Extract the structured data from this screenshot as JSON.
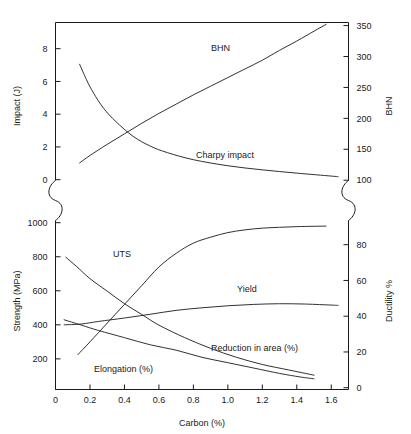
{
  "chart_data": {
    "type": "line",
    "title": "",
    "xlabel": "Carbon (%)",
    "xlim": [
      0,
      1.7
    ],
    "xticks": [
      0,
      0.2,
      0.4,
      0.6,
      0.8,
      1.0,
      1.2,
      1.4,
      1.6
    ],
    "xticklabels": [
      "0",
      "0.2",
      "0.4",
      "0.6",
      "0.8",
      "1.0",
      "1.2",
      "1.4",
      "1.6"
    ],
    "grid": false,
    "legend_position": "inline-annotations",
    "panels": [
      {
        "name": "upper-panel",
        "left_axis": {
          "label": "Impact (J)",
          "ticks": [
            0,
            2,
            4,
            6,
            8
          ],
          "ticklabels": [
            "0",
            "2",
            "4",
            "6",
            "8"
          ],
          "lim": [
            -0.6,
            9.6
          ]
        },
        "right_axis": {
          "label": "BHN",
          "ticks": [
            100,
            150,
            200,
            250,
            300,
            350
          ],
          "ticklabels": [
            "100",
            "150",
            "200",
            "250",
            "300",
            "350"
          ],
          "lim": [
            85,
            355
          ]
        },
        "series": [
          {
            "name": "BHN",
            "axis": "right",
            "label": "BHN",
            "x": [
              0.14,
              0.2,
              0.3,
              0.4,
              0.5,
              0.6,
              0.7,
              0.8,
              0.9,
              1.0,
              1.1,
              1.2,
              1.3,
              1.4,
              1.5,
              1.57
            ],
            "values": [
              128,
              140,
              158,
              175,
              192,
              208,
              223,
              238,
              252,
              266,
              280,
              294,
              310,
              325,
              341,
              352
            ]
          },
          {
            "name": "Charpy impact",
            "axis": "left",
            "label": "Charpy impact",
            "x": [
              0.14,
              0.18,
              0.22,
              0.28,
              0.35,
              0.45,
              0.55,
              0.65,
              0.8,
              1.0,
              1.2,
              1.4,
              1.6,
              1.64
            ],
            "values": [
              7.05,
              6.1,
              5.3,
              4.35,
              3.55,
              2.65,
              2.05,
              1.65,
              1.22,
              0.85,
              0.6,
              0.4,
              0.22,
              0.18
            ]
          }
        ]
      },
      {
        "name": "lower-panel",
        "left_axis": {
          "label": "Strength (MPa)",
          "ticks": [
            200,
            400,
            600,
            800,
            1000
          ],
          "ticklabels": [
            "200",
            "400",
            "600",
            "800",
            "1000"
          ],
          "lim": [
            20,
            1060
          ]
        },
        "right_axis": {
          "label": "Ductility %",
          "ticks": [
            0,
            20,
            40,
            60,
            80
          ],
          "ticklabels": [
            "0",
            "20",
            "40",
            "60",
            "80"
          ],
          "lim": [
            -1,
            98
          ]
        },
        "series": [
          {
            "name": "UTS",
            "axis": "left",
            "label": "UTS",
            "x": [
              0.13,
              0.2,
              0.3,
              0.4,
              0.5,
              0.6,
              0.7,
              0.8,
              0.9,
              1.0,
              1.1,
              1.2,
              1.3,
              1.4,
              1.5,
              1.57
            ],
            "values": [
              225,
              300,
              410,
              520,
              630,
              740,
              820,
              880,
              915,
              942,
              958,
              968,
              973,
              977,
              979,
              980
            ]
          },
          {
            "name": "Yield",
            "axis": "left",
            "label": "Yield",
            "x": [
              0.05,
              0.15,
              0.25,
              0.4,
              0.55,
              0.7,
              0.85,
              1.0,
              1.15,
              1.3,
              1.45,
              1.6,
              1.64
            ],
            "values": [
              400,
              405,
              420,
              440,
              462,
              485,
              500,
              512,
              520,
              524,
              522,
              516,
              514
            ]
          },
          {
            "name": "Reduction in area (%)",
            "axis": "right",
            "label": "Reduction in area (%)",
            "x": [
              0.06,
              0.12,
              0.2,
              0.3,
              0.4,
              0.5,
              0.6,
              0.75,
              0.9,
              1.05,
              1.2,
              1.35,
              1.45,
              1.5
            ],
            "values": [
              73,
              68,
              61,
              54,
              47,
              41,
              35,
              28,
              22,
              17,
              13,
              10,
              8,
              7
            ]
          },
          {
            "name": "Elongation (%)",
            "axis": "right",
            "label": "Elongation (%)",
            "x": [
              0.05,
              0.15,
              0.25,
              0.4,
              0.55,
              0.7,
              0.85,
              1.0,
              1.15,
              1.3,
              1.42,
              1.5
            ],
            "values": [
              38,
              35,
              32,
              28,
              24,
              21,
              17,
              14,
              11,
              8,
              6,
              5
            ]
          }
        ]
      }
    ],
    "axis_break": {
      "present": true,
      "symbol": "s-squiggle",
      "sides": [
        "left",
        "right"
      ]
    },
    "annotations": [
      {
        "text": "BHN",
        "panel": "upper",
        "x_px": 211,
        "y_px": 51
      },
      {
        "text": "Charpy impact",
        "panel": "upper",
        "x_px": 196,
        "y_px": 158
      },
      {
        "text": "UTS",
        "panel": "lower",
        "x_px": 113,
        "y_px": 257
      },
      {
        "text": "Yield",
        "panel": "lower",
        "x_px": 237,
        "y_px": 292
      },
      {
        "text": "Reduction in area (%)",
        "panel": "lower",
        "x_px": 211,
        "y_px": 351
      },
      {
        "text": "Elongation (%)",
        "panel": "lower",
        "x_px": 94,
        "y_px": 372
      }
    ],
    "colors": {
      "curve": "#1a1a1a",
      "axis": "#1a1a1a",
      "background": "#ffffff"
    }
  }
}
